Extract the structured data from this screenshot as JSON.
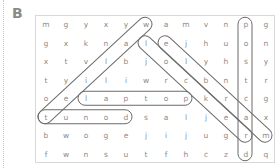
{
  "exercise": {
    "label": "B"
  },
  "grid": {
    "cols": 12,
    "rows": [
      [
        "m",
        "g",
        "y",
        "x",
        "y",
        "w",
        "a",
        "m",
        "v",
        "n",
        "p",
        "g"
      ],
      [
        "g",
        "x",
        "k",
        "n",
        "a",
        "l",
        "e",
        "j",
        "h",
        "u",
        "o",
        "n"
      ],
      [
        "x",
        "t",
        "v",
        "l",
        "b",
        "j",
        "o",
        "l",
        "y",
        "h",
        "s",
        "y"
      ],
      [
        "t",
        "y",
        "i",
        "l",
        "i",
        "w",
        "r",
        "c",
        "b",
        "n",
        "t",
        "r"
      ],
      [
        "o",
        "e",
        "l",
        "a",
        "p",
        "t",
        "o",
        "p",
        "k",
        "r",
        "c",
        "g"
      ],
      [
        "t",
        "u",
        "n",
        "o",
        "d",
        "s",
        "a",
        "l",
        "j",
        "e",
        "a",
        "x"
      ],
      [
        "b",
        "w",
        "o",
        "g",
        "e",
        "j",
        "i",
        "j",
        "u",
        "g",
        "r",
        "m"
      ],
      [
        "f",
        "w",
        "n",
        "s",
        "u",
        "t",
        "f",
        "h",
        "c",
        "z",
        "d",
        "q"
      ]
    ]
  },
  "found_words": [
    {
      "word": "wallet",
      "start": [
        0,
        5
      ],
      "end": [
        5,
        0
      ],
      "direction": "diagonal"
    },
    {
      "word": "locker",
      "start": [
        1,
        5
      ],
      "end": [
        6,
        10
      ],
      "direction": "diagonal"
    },
    {
      "word": "marble",
      "start": [
        1,
        6
      ],
      "end": [
        6,
        11
      ],
      "direction": "diagonal"
    },
    {
      "word": "postcard",
      "start": [
        0,
        10
      ],
      "end": [
        7,
        10
      ],
      "direction": "vertical"
    },
    {
      "word": "laptop",
      "start": [
        4,
        2
      ],
      "end": [
        4,
        7
      ],
      "direction": "horizontal"
    },
    {
      "word": "tunod",
      "start": [
        5,
        0
      ],
      "end": [
        5,
        4
      ],
      "direction": "horizontal"
    }
  ],
  "colors": {
    "letters": "#8a8a8a",
    "loops": "#6b6b6b",
    "border": "#d8d8d8"
  }
}
